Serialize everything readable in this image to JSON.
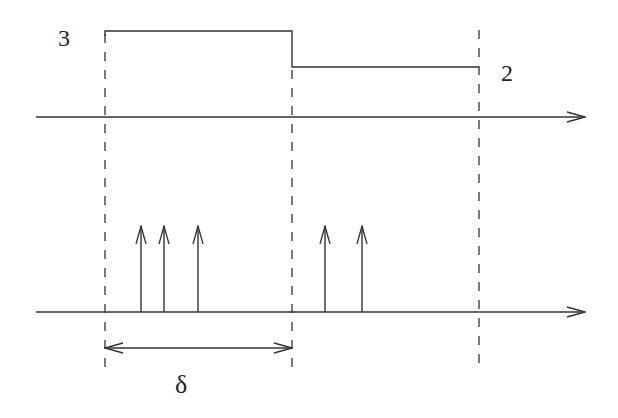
{
  "diagram": {
    "title": "",
    "colors": {
      "stroke": "#333333",
      "background": "#ffffff"
    },
    "labels": {
      "upper_level_high": "3",
      "upper_level_low": "2",
      "interval": "δ"
    },
    "upper_signal": {
      "segments": [
        {
          "from_x": 105,
          "to_x": 292,
          "level": 3
        },
        {
          "from_x": 292,
          "to_x": 479,
          "level": 2
        }
      ]
    },
    "lower_signal": {
      "impulses_x": [
        141,
        164,
        198,
        325,
        362
      ]
    },
    "dashed_dividers_x": [
      105,
      292,
      479
    ]
  }
}
